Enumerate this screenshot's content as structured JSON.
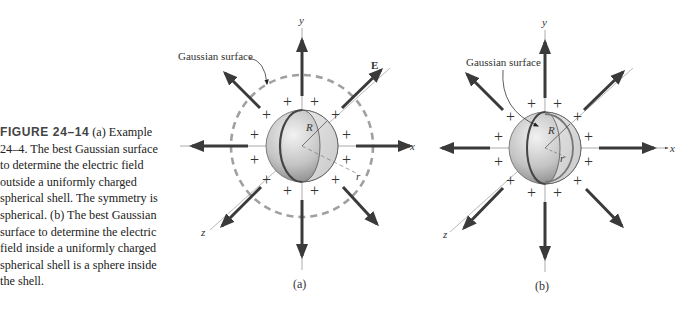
{
  "caption": {
    "label": "FIGURE 24–14",
    "text": " (a) Example 24–4. The best Gaussian surface to determine the electric field outside a uniformly charged spherical shell. The symmetry is spherical. (b) The best Gaussian surface to determine the electric field inside a uniformly charged spherical shell is a sphere inside the shell."
  },
  "panel_a": {
    "gaussian_label": "Gaussian surface",
    "field_label": "E",
    "axis_x": "x",
    "axis_y": "y",
    "axis_z": "z",
    "radius_shell": "R",
    "radius_gauss": "r",
    "sublabel": "(a)",
    "charge_symbol": "+"
  },
  "panel_b": {
    "gaussian_label": "Gaussian surface",
    "axis_x": "x",
    "axis_y": "y",
    "axis_z": "z",
    "radius_shell": "R",
    "radius_gauss": "r",
    "sublabel": "(b)",
    "charge_symbol": "+"
  },
  "colors": {
    "arrow": "#3a3a3a",
    "dashed_surface": "#9a9a9a",
    "sphere_light": "#e4e4e4",
    "sphere_dark": "#8c8c8c"
  }
}
